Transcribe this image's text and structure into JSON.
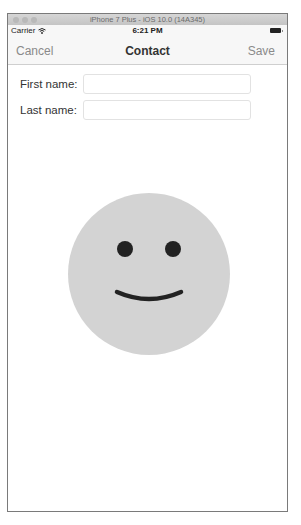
{
  "window": {
    "title": "iPhone 7 Plus - iOS 10.0 (14A345)"
  },
  "status_bar": {
    "carrier": "Carrier",
    "wifi_icon": "wifi-icon",
    "time": "6:21 PM",
    "battery_icon": "battery-icon"
  },
  "nav_bar": {
    "left_button": "Cancel",
    "title": "Contact",
    "right_button": "Save"
  },
  "form": {
    "fields": [
      {
        "label": "First name:",
        "value": "",
        "placeholder": ""
      },
      {
        "label": "Last name:",
        "value": "",
        "placeholder": ""
      }
    ]
  },
  "image": {
    "icon": "smiley-face-icon",
    "face_color": "#d3d3d3",
    "feature_color": "#222222"
  }
}
